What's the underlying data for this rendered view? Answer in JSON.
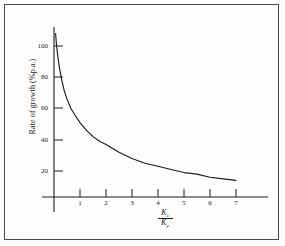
{
  "figure": {
    "background_color": "#fdfdfc",
    "border_color": "#4a4a4a",
    "ink_color": "#1c1c1c"
  },
  "axis_titles": {
    "y": "Rate of growth (%p.a.)",
    "x_numerator": "K",
    "x_numerator_sub": "c",
    "x_denominator": "K",
    "x_denominator_sub": "p"
  },
  "ticks": {
    "y": [
      "20",
      "40",
      "60",
      "80",
      "100"
    ],
    "x": [
      "1",
      "2",
      "3",
      "4",
      "5",
      "6",
      "7"
    ]
  },
  "chart_data": {
    "type": "line",
    "title": "",
    "subtitle": "",
    "xlabel": "Kc/Kp",
    "ylabel": "Rate of growth (%p.a.)",
    "xlim": [
      0,
      7.9
    ],
    "ylim": [
      0,
      110
    ],
    "xticks": [
      1,
      2,
      3,
      4,
      5,
      6,
      7
    ],
    "yticks": [
      20,
      40,
      60,
      80,
      100
    ],
    "grid": false,
    "legend": null,
    "annotations": [],
    "series": [
      {
        "name": "Rate of growth",
        "x": [
          0.06,
          0.1,
          0.15,
          0.2,
          0.3,
          0.4,
          0.5,
          0.65,
          0.8,
          1.0,
          1.25,
          1.5,
          1.75,
          2.0,
          2.5,
          3.0,
          3.5,
          4.0,
          4.5,
          5.0,
          5.5,
          6.0,
          6.5,
          7.0
        ],
        "y": [
          108,
          100,
          93,
          87,
          78,
          71,
          66,
          60,
          56,
          51,
          46,
          42,
          39,
          37,
          32,
          28,
          25,
          23,
          21,
          19,
          18,
          16,
          15,
          14
        ]
      }
    ]
  }
}
